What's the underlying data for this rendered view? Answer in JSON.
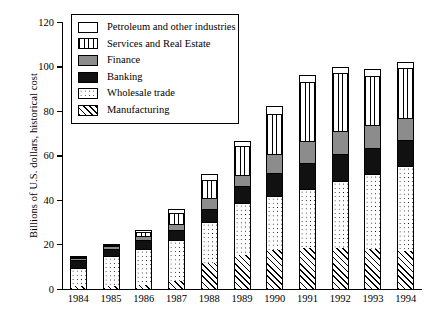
{
  "chart_data": {
    "type": "bar",
    "subtype": "stacked-vertical",
    "title": "",
    "xlabel": "",
    "ylabel": "Billions of U.S. dollars, historical cost",
    "ylim": [
      0,
      120
    ],
    "yticks": [
      0,
      20,
      40,
      60,
      80,
      100,
      120
    ],
    "grid": false,
    "legend_position": "top-left-inside",
    "categories": [
      "1984",
      "1985",
      "1986",
      "1987",
      "1988",
      "1989",
      "1990",
      "1991",
      "1992",
      "1993",
      "1994"
    ],
    "series": [
      {
        "name": "Manufacturing",
        "fill": "diagonal-hatch",
        "values": [
          1.0,
          1.2,
          1.5,
          3.5,
          11.5,
          15.0,
          17.5,
          18.5,
          18.5,
          18.0,
          17.0
        ]
      },
      {
        "name": "Wholesale trade",
        "fill": "dotted",
        "values": [
          9.5,
          14.5,
          18.0,
          22.0,
          30.0,
          38.5,
          41.5,
          45.0,
          48.5,
          51.5,
          55.0
        ]
      },
      {
        "name": "Banking",
        "fill": "solid-black",
        "values": [
          13.0,
          18.0,
          22.0,
          26.5,
          36.0,
          46.0,
          52.0,
          56.5,
          60.5,
          63.5,
          67.0
        ]
      },
      {
        "name": "Finance",
        "fill": "solid-gray",
        "values": [
          13.8,
          19.0,
          23.5,
          29.0,
          41.0,
          51.0,
          60.5,
          66.5,
          71.0,
          73.5,
          77.0
        ]
      },
      {
        "name": "Services and Real Estate",
        "fill": "vertical-stripes",
        "values": [
          14.3,
          19.6,
          25.5,
          34.0,
          49.0,
          64.0,
          78.5,
          93.0,
          97.0,
          95.5,
          99.5
        ]
      },
      {
        "name": "Petroleum and other industries",
        "fill": "white",
        "values": [
          14.8,
          20.2,
          26.5,
          36.0,
          51.5,
          66.5,
          82.0,
          96.0,
          100.0,
          99.0,
          102.0
        ]
      }
    ],
    "series_note": "values are cumulative stack tops per category",
    "annotations": []
  },
  "legend": {
    "items": [
      {
        "label": "Petroleum and other industries",
        "fill_class": "f-petroleum"
      },
      {
        "label": "Services and Real Estate",
        "fill_class": "f-services"
      },
      {
        "label": "Finance",
        "fill_class": "f-finance"
      },
      {
        "label": "Banking",
        "fill_class": "f-banking"
      },
      {
        "label": "Wholesale trade",
        "fill_class": "f-wholesale"
      },
      {
        "label": "Manufacturing",
        "fill_class": "f-manufacturing"
      }
    ]
  }
}
